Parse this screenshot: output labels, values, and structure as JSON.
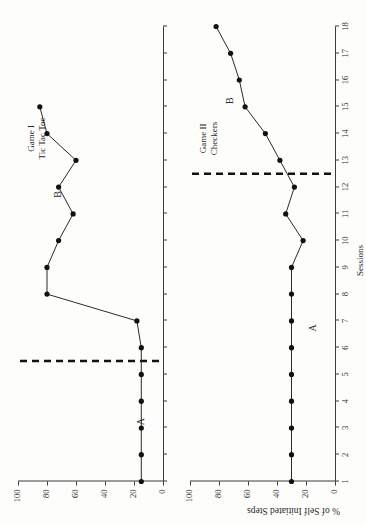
{
  "figure": {
    "y_axis_label": "% of Self Initiated Steps",
    "x_axis_label": "Sessions",
    "rotation_note": "90"
  },
  "panels": [
    {
      "id": "game-1",
      "title_line1": "Game I",
      "title_line2": "Tic Tac Toe",
      "phase_a_label": "A",
      "phase_b_label": "B",
      "phase_change_session": 5.5
    },
    {
      "id": "game-2",
      "title_line1": "Game II",
      "title_line2": "Checkers",
      "phase_a_label": "A",
      "phase_b_label": "B",
      "phase_change_session": 12.5
    }
  ],
  "chart_data": [
    {
      "type": "line",
      "title": "Game I  Tic Tac Toe",
      "xlabel": "Sessions",
      "ylabel": "% of Self Initiated Steps",
      "xlim": [
        1,
        18
      ],
      "ylim": [
        0,
        100
      ],
      "yticks": [
        0,
        20,
        40,
        60,
        80,
        100
      ],
      "xticks": [
        1,
        2,
        3,
        4,
        5,
        6,
        7,
        8,
        9,
        10,
        11,
        12,
        13,
        14,
        15,
        16,
        17,
        18
      ],
      "grid": false,
      "legend": "none",
      "phase_change_at": 5.5,
      "phases": [
        {
          "label": "A",
          "sessions": [
            1,
            5
          ]
        },
        {
          "label": "B",
          "sessions": [
            6,
            15
          ]
        }
      ],
      "x": [
        1,
        2,
        3,
        4,
        5,
        6,
        7,
        8,
        9,
        10,
        11,
        12,
        13,
        14,
        15
      ],
      "y": [
        15,
        15,
        15,
        15,
        15,
        15,
        18,
        80,
        80,
        72,
        62,
        72,
        60,
        80,
        85
      ]
    },
    {
      "type": "line",
      "title": "Game II  Checkers",
      "xlabel": "Sessions",
      "ylabel": "% of Self Initiated Steps",
      "xlim": [
        1,
        18
      ],
      "ylim": [
        0,
        100
      ],
      "yticks": [
        0,
        20,
        40,
        60,
        80,
        100
      ],
      "xticks": [
        1,
        2,
        3,
        4,
        5,
        6,
        7,
        8,
        9,
        10,
        11,
        12,
        13,
        14,
        15,
        16,
        17,
        18
      ],
      "grid": false,
      "legend": "none",
      "phase_change_at": 12.5,
      "phases": [
        {
          "label": "A",
          "sessions": [
            1,
            12
          ]
        },
        {
          "label": "B",
          "sessions": [
            13,
            18
          ]
        }
      ],
      "x": [
        1,
        2,
        3,
        4,
        5,
        6,
        7,
        8,
        9,
        10,
        11,
        12,
        13,
        14,
        15,
        16,
        17,
        18
      ],
      "y": [
        30,
        30,
        30,
        30,
        30,
        30,
        30,
        30,
        30,
        22,
        34,
        28,
        38,
        48,
        62,
        66,
        72,
        82
      ]
    }
  ],
  "ticks": {
    "y": [
      "0",
      "20",
      "40",
      "60",
      "80",
      "100"
    ],
    "x": [
      "1",
      "2",
      "3",
      "4",
      "5",
      "6",
      "7",
      "8",
      "9",
      "10",
      "11",
      "12",
      "13",
      "14",
      "15",
      "16",
      "17",
      "18"
    ]
  }
}
